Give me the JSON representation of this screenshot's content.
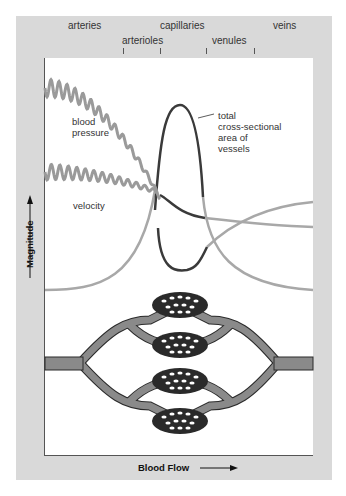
{
  "segments": {
    "top_row": [
      "arteries",
      "capillaries",
      "veins"
    ],
    "bottom_row": [
      "arterioles",
      "venules"
    ]
  },
  "axes": {
    "y_label": "Magnitude",
    "x_label": "Blood Flow"
  },
  "curves": {
    "blood_pressure": "blood\npressure",
    "velocity": "velocity",
    "cross_section": "total\ncross-sectional\narea of\nvessels"
  },
  "colors": {
    "frame": "#d9d9d9",
    "pressure_curve": "#9a9a9a",
    "area_curve_dark": "#3a3a3a",
    "vessel_fill": "#8a8a8a",
    "capillary_fill": "#2a2a2a"
  }
}
